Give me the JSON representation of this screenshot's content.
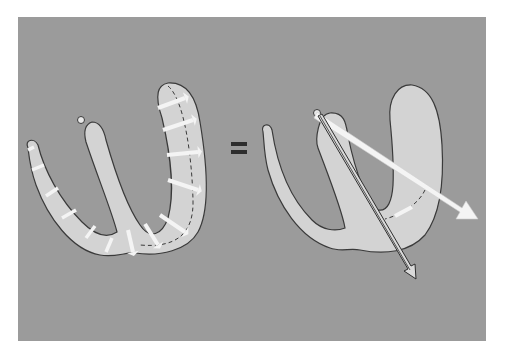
{
  "figure": {
    "equals_symbol": "=",
    "colors": {
      "background": "#9b9b9b",
      "tissue_fill": "#d3d3d3",
      "outline": "#3a3a3a",
      "arrow_fill": "#f4f4f4",
      "equals": "#2e2e2e"
    },
    "left_panel": {
      "label": "local-vectors",
      "vector_count": 13
    },
    "right_panel": {
      "label": "resultant-vectors",
      "vectors": [
        "resultant-white-arrow",
        "resultant-outlined-arrow"
      ]
    }
  }
}
